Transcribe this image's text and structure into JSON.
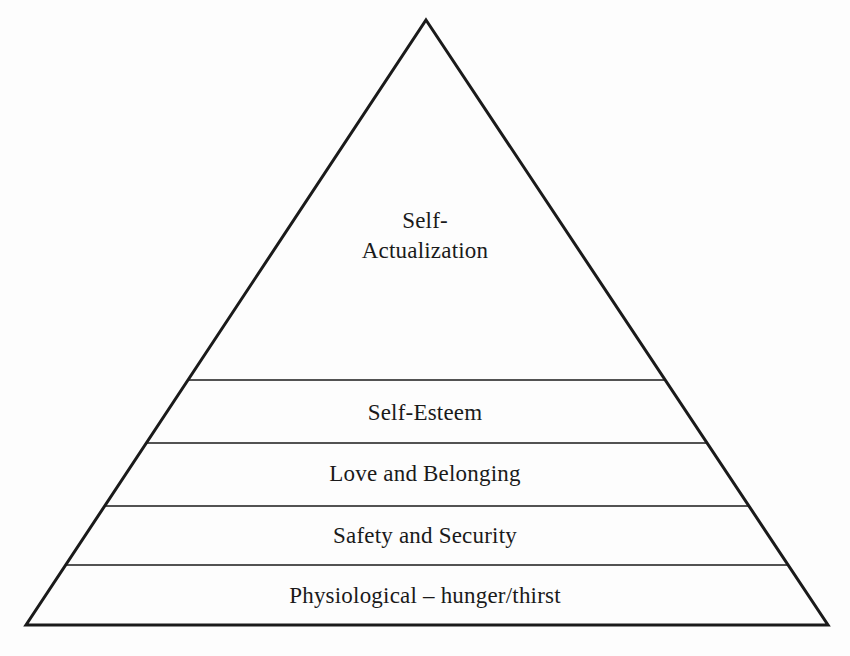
{
  "diagram": {
    "type": "pyramid",
    "title": "",
    "background_color": "#fdfdfd",
    "stroke_color": "#1a1a1a",
    "text_color": "#1a1a1a",
    "outline_width_px": 3,
    "divider_width_px": 1.5,
    "apex": {
      "x": 426,
      "y": 20
    },
    "base_left": {
      "x": 26,
      "y": 625
    },
    "base_right": {
      "x": 828,
      "y": 625
    },
    "divider_y": [
      380,
      443,
      506,
      565
    ],
    "tiers": [
      {
        "index": 0,
        "label": "Self-\nActualization",
        "label_lines": [
          "Self-",
          "Actualization"
        ],
        "position": "top"
      },
      {
        "index": 1,
        "label": "Self-Esteem",
        "label_lines": [
          "Self-Esteem"
        ],
        "position": "second"
      },
      {
        "index": 2,
        "label": "Love and Belonging",
        "label_lines": [
          "Love and Belonging"
        ],
        "position": "third"
      },
      {
        "index": 3,
        "label": "Safety and Security",
        "label_lines": [
          "Safety and Security"
        ],
        "position": "fourth"
      },
      {
        "index": 4,
        "label": "Physiological – hunger/thirst",
        "label_lines": [
          "Physiological – hunger/thirst"
        ],
        "position": "base"
      }
    ]
  }
}
